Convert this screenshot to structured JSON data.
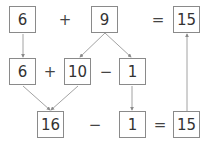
{
  "diagram": {
    "row1": {
      "a": "6",
      "op1": "+",
      "b": "9",
      "eq": "=",
      "result": "15"
    },
    "row2": {
      "a": "6",
      "op1": "+",
      "b": "10",
      "op2": "−",
      "c": "1"
    },
    "row3": {
      "a": "16",
      "op1": "−",
      "b": "1",
      "eq": "=",
      "result": "15"
    },
    "colors": {
      "line": "#8a8a8a",
      "text": "#333333"
    },
    "arrows": [
      {
        "from": "row1.a",
        "to": "row2.a"
      },
      {
        "from": "row1.b",
        "to": "row2.b"
      },
      {
        "from": "row1.b",
        "to": "row2.c"
      },
      {
        "from": "row2.a",
        "to": "row3.a"
      },
      {
        "from": "row2.b",
        "to": "row3.a"
      },
      {
        "from": "row2.c",
        "to": "row3.b"
      },
      {
        "from": "row3.result",
        "to": "row1.result"
      }
    ]
  }
}
